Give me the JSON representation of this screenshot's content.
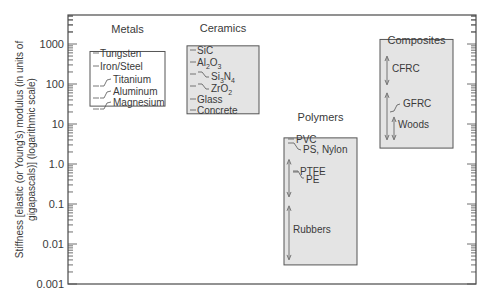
{
  "chart_data": {
    "type": "range-chart",
    "title": "",
    "ylabel": "Stiffness [elastic (or Young's) modulus (in units of gigapascals)] (logarithmic scale)",
    "ylabel_lines": [
      "Stiffness [elastic (or Young's) modulus (in units of",
      "gigapascals)] (logarithmic scale)"
    ],
    "yscale": "log",
    "ylim": [
      0.001,
      5000
    ],
    "yticks": [
      0.001,
      0.01,
      0.1,
      1.0,
      10,
      100,
      1000
    ],
    "ytick_labels": [
      "0.001",
      "0.01",
      "0.1",
      "1.0",
      "10",
      "100",
      "1000"
    ],
    "grid": false,
    "groups": [
      {
        "name": "Metals",
        "box_range": [
          28,
          650
        ],
        "fill": "#ffffff",
        "entries": [
          {
            "label": "Tungsten",
            "value": 407,
            "style": "dash"
          },
          {
            "label": "Iron/Steel",
            "value": 207,
            "style": "dash"
          },
          {
            "label": "Titanium",
            "value": 107,
            "style": "leader"
          },
          {
            "label": "Aluminum",
            "value": 69,
            "style": "leader"
          },
          {
            "label": "Magnesium",
            "value": 45,
            "style": "leader"
          }
        ]
      },
      {
        "name": "Ceramics",
        "box_range": [
          18,
          900
        ],
        "fill": "#e4e4e4",
        "entries": [
          {
            "label": "SiC",
            "value": 450,
            "style": "dash"
          },
          {
            "label": "Al2O3",
            "value": 380,
            "style": "dash",
            "sub": [
              "Al",
              "2",
              "O",
              "3"
            ]
          },
          {
            "label": "Si3N4",
            "value": 304,
            "style": "leader",
            "sub": [
              "Si",
              "3",
              "N",
              "4"
            ]
          },
          {
            "label": "ZrO2",
            "value": 205,
            "style": "leader",
            "sub": [
              "ZrO",
              "2"
            ]
          },
          {
            "label": "Glass",
            "value": 69,
            "style": "dash"
          },
          {
            "label": "Concrete",
            "value": 30,
            "style": "dash"
          }
        ]
      },
      {
        "name": "Polymers",
        "box_range": [
          0.003,
          4.5
        ],
        "fill": "#e4e4e4",
        "entries": [
          {
            "label": "PVC",
            "value": 3.4,
            "style": "dash"
          },
          {
            "label": "PS, Nylon",
            "value": 2.8,
            "style": "leader"
          },
          {
            "label": "PTFE",
            "value": 0.5,
            "style": "dash",
            "range": [
              0.15,
              1.3
            ]
          },
          {
            "label": "PE",
            "value": 0.3,
            "style": "leader"
          },
          {
            "label": "Rubbers",
            "value": 0.02,
            "style": "range",
            "range": [
              0.004,
              0.09
            ]
          }
        ]
      },
      {
        "name": "Composites",
        "box_range": [
          2.5,
          1300
        ],
        "fill": "#e4e4e4",
        "entries": [
          {
            "label": "CFRC",
            "style": "range",
            "range": [
              95,
              500
            ]
          },
          {
            "label": "GFRC",
            "style": "range",
            "range": [
              4,
              60
            ]
          },
          {
            "label": "Woods",
            "style": "range",
            "range": [
              4,
              15
            ]
          }
        ]
      }
    ]
  }
}
